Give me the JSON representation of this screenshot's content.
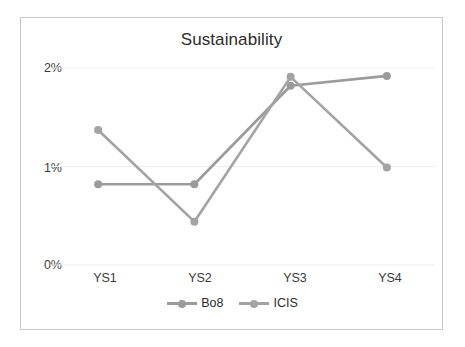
{
  "chart_data": {
    "type": "line",
    "title": "Sustainability",
    "xlabel": "",
    "ylabel": "",
    "categories": [
      "YS1",
      "YS2",
      "YS3",
      "YS4"
    ],
    "ytick_labels": [
      "0%",
      "1%",
      "2%"
    ],
    "ytick_values": [
      0,
      1,
      2
    ],
    "ylim": [
      0,
      2.15
    ],
    "grid": true,
    "legend_position": "bottom",
    "series": [
      {
        "name": "Bo8",
        "color": "#9b9b9b",
        "values": [
          0.82,
          0.82,
          1.82,
          1.92
        ]
      },
      {
        "name": "ICIS",
        "color": "#a3a3a3",
        "values": [
          1.37,
          0.44,
          1.91,
          0.99
        ]
      }
    ]
  },
  "colors": {
    "frame_border": "#c9c9c9",
    "gridline": "#ededed",
    "text": "#2b2b2b",
    "series_bo8": "#9b9b9b",
    "series_icis": "#a3a3a3"
  }
}
